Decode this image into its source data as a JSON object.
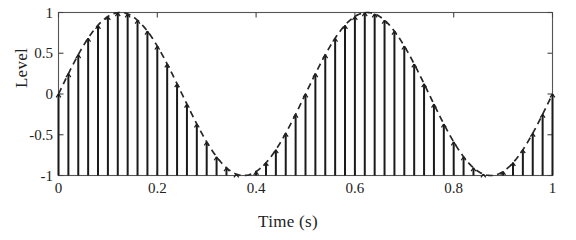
{
  "chart_data": {
    "type": "line",
    "title": "",
    "xlabel": "Time (s)",
    "ylabel": "Level",
    "xlim": [
      0,
      1
    ],
    "ylim": [
      -1,
      1
    ],
    "grid": false,
    "legend": null,
    "xticks": [
      "0",
      "0.2",
      "0.4",
      "0.6",
      "0.8",
      "1"
    ],
    "xtick_values": [
      0,
      0.2,
      0.4,
      0.6,
      0.8,
      1
    ],
    "yticks": [
      "1",
      "0.5",
      "0",
      "-0.5",
      "-1"
    ],
    "ytick_values": [
      1,
      0.5,
      0,
      -0.5,
      -1
    ],
    "series": [
      {
        "name": "envelope",
        "style": "dashed",
        "color": "#262626",
        "description": "Two-cycle sine wave, amplitude 1, over 0 to 1 second",
        "equation": "y = sin(4*pi*x)",
        "cycles": 2,
        "amplitude": 1,
        "x": [
          0,
          0.025,
          0.05,
          0.075,
          0.1,
          0.125,
          0.15,
          0.175,
          0.2,
          0.225,
          0.25,
          0.275,
          0.3,
          0.325,
          0.35,
          0.375,
          0.4,
          0.425,
          0.45,
          0.475,
          0.5,
          0.525,
          0.55,
          0.575,
          0.6,
          0.625,
          0.65,
          0.675,
          0.7,
          0.725,
          0.75,
          0.775,
          0.8,
          0.825,
          0.85,
          0.875,
          0.9,
          0.925,
          0.95,
          0.975,
          1
        ],
        "values": [
          0,
          0.309,
          0.588,
          0.809,
          0.951,
          1,
          0.951,
          0.809,
          0.588,
          0.309,
          0,
          -0.309,
          -0.588,
          -0.809,
          -0.951,
          -1,
          -0.951,
          -0.809,
          -0.588,
          -0.309,
          0,
          0.309,
          0.588,
          0.809,
          0.951,
          1,
          0.951,
          0.809,
          0.588,
          0.309,
          0,
          -0.309,
          -0.588,
          -0.809,
          -0.951,
          -1,
          -0.951,
          -0.809,
          -0.588,
          -0.309,
          0
        ]
      },
      {
        "name": "samples",
        "style": "stem",
        "color": "#1a1a1a",
        "description": "Vertical stems drawn from baseline -1 up to the sine envelope at each sample",
        "baseline": -1,
        "sample_count": 51,
        "sample_interval": 0.02,
        "x": [
          0,
          0.02,
          0.04,
          0.06,
          0.08,
          0.1,
          0.12,
          0.14,
          0.16,
          0.18,
          0.2,
          0.22,
          0.24,
          0.26,
          0.28,
          0.3,
          0.32,
          0.34,
          0.36,
          0.38,
          0.4,
          0.42,
          0.44,
          0.46,
          0.48,
          0.5,
          0.52,
          0.54,
          0.56,
          0.58,
          0.6,
          0.62,
          0.64,
          0.66,
          0.68,
          0.7,
          0.72,
          0.74,
          0.76,
          0.78,
          0.8,
          0.82,
          0.84,
          0.86,
          0.88,
          0.9,
          0.92,
          0.94,
          0.96,
          0.98,
          1
        ],
        "values": [
          0,
          0.249,
          0.482,
          0.684,
          0.841,
          0.951,
          0.998,
          0.982,
          0.905,
          0.771,
          0.588,
          0.368,
          0.125,
          -0.125,
          -0.368,
          -0.588,
          -0.771,
          -0.905,
          -0.982,
          -0.998,
          -0.951,
          -0.841,
          -0.684,
          -0.482,
          -0.249,
          0,
          0.249,
          0.482,
          0.684,
          0.841,
          0.951,
          0.998,
          0.982,
          0.905,
          0.771,
          0.588,
          0.368,
          0.125,
          -0.125,
          -0.368,
          -0.588,
          -0.771,
          -0.905,
          -0.982,
          -0.998,
          -0.951,
          -0.841,
          -0.684,
          -0.482,
          -0.249,
          0
        ]
      }
    ]
  },
  "axes": {
    "box_color": "#555555",
    "tick_color": "#444444"
  }
}
